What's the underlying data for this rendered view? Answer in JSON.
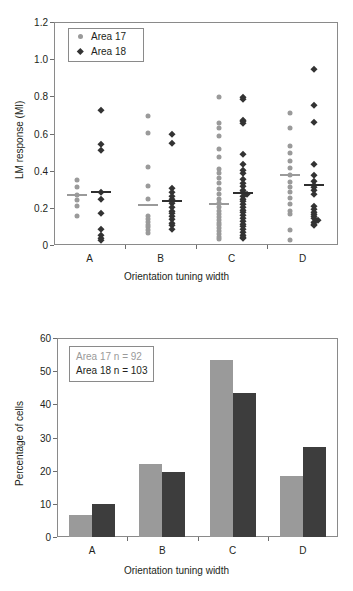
{
  "chart_data": [
    {
      "type": "scatter",
      "title": "",
      "xlabel": "Orientation tuning width",
      "ylabel": "LM response (MI)",
      "categories": [
        "A",
        "B",
        "C",
        "D"
      ],
      "ylim": [
        0,
        1.2
      ],
      "yticks": [
        "0",
        "0.2",
        "0.4",
        "0.6",
        "0.8",
        "1.0",
        "1.2"
      ],
      "ytick_values": [
        0,
        0.2,
        0.4,
        0.6,
        0.8,
        1.0,
        1.2
      ],
      "grid": false,
      "legend_position": "top-left",
      "series": [
        {
          "name": "Area 17",
          "marker": "circle",
          "color": "#9a9a9a",
          "points": {
            "A": [
              0.35,
              0.31,
              0.27,
              0.24,
              0.21,
              0.155
            ],
            "B": [
              0.695,
              0.605,
              0.42,
              0.32,
              0.25,
              0.155,
              0.14,
              0.125,
              0.11,
              0.095,
              0.08,
              0.065
            ],
            "C": [
              0.795,
              0.655,
              0.63,
              0.585,
              0.515,
              0.475,
              0.41,
              0.385,
              0.36,
              0.335,
              0.3,
              0.275,
              0.25,
              0.225,
              0.205,
              0.185,
              0.165,
              0.15,
              0.135,
              0.12,
              0.105,
              0.09,
              0.075,
              0.06,
              0.045,
              0.03
            ],
            "D": [
              0.71,
              0.63,
              0.535,
              0.495,
              0.45,
              0.415,
              0.375,
              0.34,
              0.31,
              0.285,
              0.255,
              0.22,
              0.185,
              0.165,
              0.08,
              0.025
            ]
          },
          "medians": {
            "A": 0.27,
            "B": 0.215,
            "C": 0.218,
            "D": 0.378
          }
        },
        {
          "name": "Area 18",
          "marker": "diamond",
          "color": "#333333",
          "points": {
            "A": [
              0.725,
              0.545,
              0.51,
              0.285,
              0.25,
              0.17,
              0.085,
              0.055,
              0.04,
              0.025
            ],
            "B": [
              0.6,
              0.547,
              0.305,
              0.285,
              0.265,
              0.245,
              0.235,
              0.225,
              0.205,
              0.185,
              0.17,
              0.155,
              0.14,
              0.12,
              0.105,
              0.085
            ],
            "C": [
              0.795,
              0.785,
              0.675,
              0.665,
              0.655,
              0.49,
              0.435,
              0.405,
              0.385,
              0.355,
              0.335,
              0.315,
              0.295,
              0.285,
              0.275,
              0.265,
              0.25,
              0.235,
              0.22,
              0.205,
              0.19,
              0.175,
              0.16,
              0.145,
              0.13,
              0.115,
              0.1,
              0.085,
              0.07,
              0.055,
              0.045,
              0.035
            ],
            "D": [
              0.945,
              0.755,
              0.66,
              0.435,
              0.375,
              0.345,
              0.325,
              0.31,
              0.295,
              0.275,
              0.21,
              0.195,
              0.18,
              0.165,
              0.155,
              0.145,
              0.135,
              0.125,
              0.115,
              0.105
            ]
          },
          "medians": {
            "A": 0.285,
            "B": 0.238,
            "C": 0.282,
            "D": 0.325
          }
        }
      ]
    },
    {
      "type": "bar",
      "title": "",
      "xlabel": "Orientation tuning width",
      "ylabel": "Percentage of cells",
      "categories": [
        "A",
        "B",
        "C",
        "D"
      ],
      "ylim": [
        0,
        60
      ],
      "yticks": [
        "0",
        "10",
        "20",
        "30",
        "40",
        "50",
        "60"
      ],
      "ytick_values": [
        0,
        10,
        20,
        30,
        40,
        50,
        60
      ],
      "grid": false,
      "legend_position": "top-left",
      "series": [
        {
          "name": "Area 17",
          "color": "#9a9a9a",
          "values": [
            6.5,
            22.0,
            53.5,
            18.5
          ]
        },
        {
          "name": "Area 18",
          "color": "#3d3d3d",
          "values": [
            10.0,
            19.5,
            43.5,
            27.0
          ]
        }
      ],
      "annotations": [
        {
          "text": "Area 17 n = 92",
          "color": "#9a9a9a"
        },
        {
          "text": "Area 18 n = 103",
          "color": "#231f20"
        }
      ]
    }
  ],
  "scatter": {
    "ylabel": "LM response (MI)",
    "xlabel": "Orientation tuning width",
    "legend": {
      "item_0": "Area 17",
      "item_1": "Area 18"
    }
  },
  "bar": {
    "ylabel": "Percentage of cells",
    "xlabel": "Orientation tuning width",
    "nbox": {
      "line_0": "Area 17 n = 92",
      "line_1": "Area 18 n = 103"
    }
  }
}
